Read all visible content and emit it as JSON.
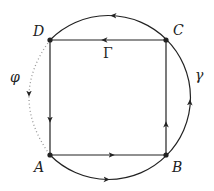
{
  "diagram": {
    "type": "contour-diagram",
    "colors": {
      "stroke": "#222222",
      "dotted": "#9a9a9a",
      "background": "#ffffff"
    },
    "vertices": [
      {
        "id": "A",
        "label": "A",
        "x": 50,
        "y": 155
      },
      {
        "id": "B",
        "label": "B",
        "x": 166,
        "y": 155
      },
      {
        "id": "C",
        "label": "C",
        "x": 166,
        "y": 40
      },
      {
        "id": "D",
        "label": "D",
        "x": 50,
        "y": 40
      }
    ],
    "square": {
      "label": "Γ",
      "edges": [
        {
          "from": "A",
          "to": "B",
          "direction": "right"
        },
        {
          "from": "B",
          "to": "C",
          "direction": "up"
        },
        {
          "from": "C",
          "to": "D",
          "direction": "left"
        },
        {
          "from": "D",
          "to": "A",
          "direction": "down"
        }
      ]
    },
    "arc_gamma": {
      "label": "γ",
      "description": "outer circular arc from A through B, C to D (counter-clockwise)"
    },
    "arc_phi": {
      "label": "φ",
      "style": "dotted",
      "description": "dotted arc from D to A on the left, arrow pointing down"
    }
  }
}
